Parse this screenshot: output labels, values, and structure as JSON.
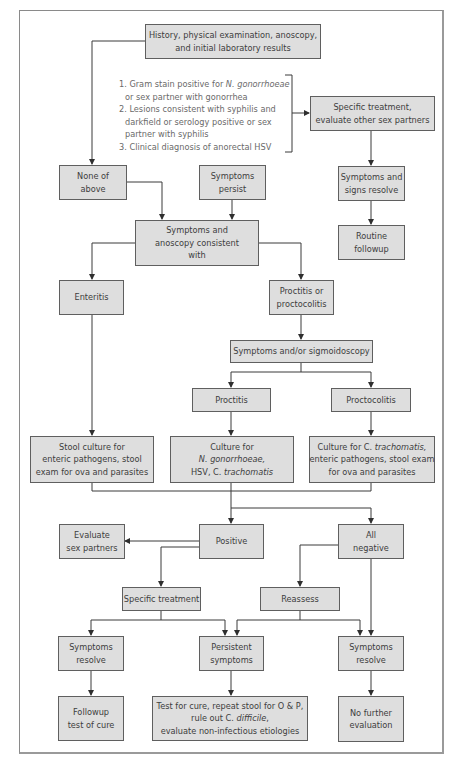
{
  "nodes": {
    "history": [
      "History, physical examination, anoscopy,",
      "and initial laboratory results"
    ],
    "criteria": {
      "item1_prefix": "1. Gram stain positive for ",
      "item1_italic": "N. gonorrhoeae",
      "item1_line2": "or sex partner with gonorrhea",
      "item2_line1": "2. Lesions consistent with syphilis and",
      "item2_line2": "darkfield or serology positive or sex",
      "item2_line3": "partner with syphilis",
      "item3": "3. Clinical diagnosis of anorectal HSV"
    },
    "specific_treatment_top": [
      "Specific treatment,",
      "evaluate other sex partners"
    ],
    "none_of_above": [
      "None of",
      "above"
    ],
    "symptoms_persist": [
      "Symptoms",
      "persist"
    ],
    "symptoms_signs_resolve": [
      "Symptoms and",
      "signs resolve"
    ],
    "routine_followup": [
      "Routine",
      "followup"
    ],
    "symptoms_anoscopy": [
      "Symptoms and",
      "anoscopy consistent",
      "with"
    ],
    "enteritis": "Enteritis",
    "proctitis_or_proctocolitis": [
      "Proctitis or",
      "proctocolitis"
    ],
    "sigmoidoscopy": "Symptoms and/or sigmoidoscopy",
    "proctitis": "Proctitis",
    "proctocolitis": "Proctocolitis",
    "stool_culture": [
      "Stool culture for",
      "enteric pathogens, stool",
      "exam for ova and parasites"
    ],
    "culture_ng": {
      "line1": "Culture for",
      "line2_italic": "N. gonorrhoeae,",
      "line3_prefix": "HSV, C. ",
      "line3_italic": "trachomatis"
    },
    "culture_ct": {
      "line1_prefix": "Culture for C. ",
      "line1_italic": "trachomatis,",
      "line2": "enteric pathogens, stool exam",
      "line3": "for ova and parasites"
    },
    "evaluate_sex_partners": [
      "Evaluate",
      "sex partners"
    ],
    "positive": "Positive",
    "all_negative": [
      "All",
      "negative"
    ],
    "specific_treatment": "Specific treatment",
    "reassess": "Reassess",
    "symptoms_resolve_left": [
      "Symptoms",
      "resolve"
    ],
    "persistent_symptoms": [
      "Persistent",
      "symptoms"
    ],
    "symptoms_resolve_right": [
      "Symptoms",
      "resolve"
    ],
    "followup_test_of_cure": [
      "Followup",
      "test of cure"
    ],
    "test_for_cure": {
      "line1": "Test for cure, repeat stool for O & P,",
      "line2_prefix": "rule out C. ",
      "line2_italic": "difficile",
      "line2_suffix": ",",
      "line3": "evaluate non-infectious etiologies"
    },
    "no_further_evaluation": [
      "No further",
      "evaluation"
    ]
  },
  "colors": {
    "box_fill": "#dedede",
    "box_border": "#5f5f5f",
    "line": "#3a3a3a",
    "text": "#3d3d3d",
    "criteria_text": "#6a6a6a",
    "frame": "#8a8a8a"
  }
}
